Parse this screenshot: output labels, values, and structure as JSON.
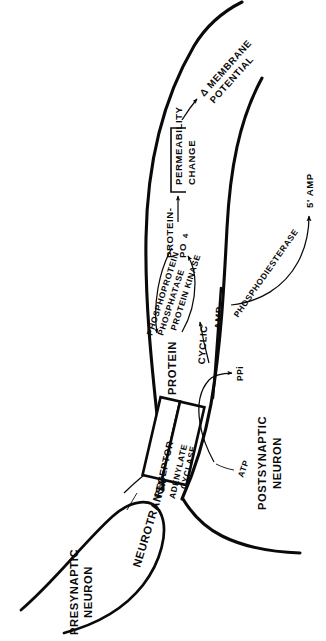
{
  "figure": {
    "background_color": "#ffffff",
    "ink_color": "#0a0a0a"
  },
  "cells": {
    "presynaptic": "PRESYNAPTIC\nNEURON",
    "presynaptic_line1": "PRESYNAPTIC",
    "presynaptic_line2": "NEURON",
    "postsynaptic_line1": "POSTSYNAPTIC",
    "postsynaptic_line2": "NEURON"
  },
  "membrane_proteins": {
    "receptor": "RECEPTOR",
    "cyclase_line1": "ADENYLATE",
    "cyclase_line2": "CYCLASE"
  },
  "labels": {
    "neurotransmitter": "NEUROTRANSMITTER",
    "atp": "ATP",
    "ppi": "PPi",
    "cyclic": "CYCLIC",
    "amp": "AMP",
    "phosphodiesterase": "PHOSPHODIESTERASE",
    "five_prime_amp": "5' AMP",
    "protein_kinase": "PROTEIN KINASE",
    "phosphoprotein": "PHOSPHOPROTEIN",
    "phosphatase": "PHOSPHATASE",
    "protein": "PROTEIN",
    "protein_po4_line1": "PROTEIN-",
    "protein_po4_line2": "PO",
    "protein_po4_sub": "4",
    "permeability_line1": "PERMEABILITY",
    "permeability_line2": "CHANGE",
    "delta_membrane": "Δ MEMBRANE",
    "potential": "POTENTIAL"
  },
  "pathway": {
    "steps": [
      "NEUROTRANSMITTER binds RECEPTOR",
      "ADENYLATE CYCLASE converts ATP to CYCLIC AMP releasing PPi",
      "CYCLIC AMP activates PROTEIN KINASE",
      "PROTEIN KINASE phosphorylates PROTEIN to PROTEIN-PO4",
      "PHOSPHOPROTEIN PHOSPHATASE reverses PROTEIN-PO4 to PROTEIN",
      "PROTEIN-PO4 causes PERMEABILITY CHANGE",
      "PERMEABILITY CHANGE yields Δ MEMBRANE POTENTIAL",
      "PHOSPHODIESTERASE degrades CYCLIC AMP to 5' AMP"
    ]
  }
}
